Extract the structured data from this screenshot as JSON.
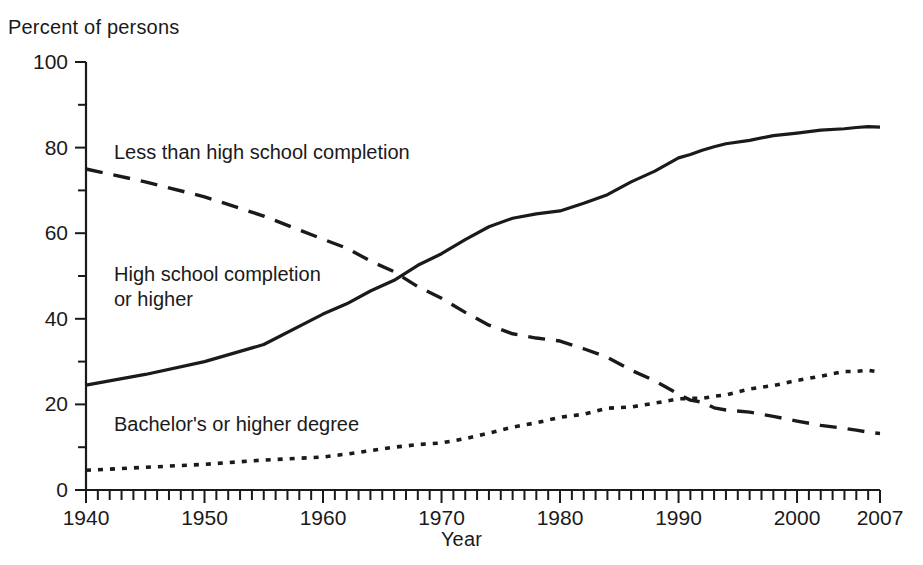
{
  "chart_data": {
    "type": "line",
    "title": "",
    "ylabel": "Percent of persons",
    "xlabel": "Year",
    "xlim": [
      1940,
      2007
    ],
    "ylim": [
      0,
      100
    ],
    "grid": false,
    "legend_position": "inline-annotations",
    "y_ticks": [
      0,
      20,
      40,
      60,
      80,
      100
    ],
    "y_minor_tick_interval": 10,
    "x_ticks": [
      1940,
      1950,
      1960,
      1970,
      1980,
      1990,
      2000,
      2007
    ],
    "x_minor_tick_interval": 1,
    "x": [
      1940,
      1945,
      1950,
      1955,
      1960,
      1962,
      1964,
      1966,
      1968,
      1970,
      1972,
      1974,
      1976,
      1978,
      1980,
      1982,
      1984,
      1986,
      1988,
      1990,
      1991,
      1992,
      1993,
      1994,
      1996,
      1998,
      2000,
      2002,
      2004,
      2005,
      2006,
      2007
    ],
    "series": [
      {
        "name": "Less than high school completion",
        "style": "dashed",
        "values": [
          75.0,
          72.0,
          68.5,
          64.0,
          58.6,
          56.5,
          53.5,
          51.0,
          47.5,
          44.8,
          41.5,
          38.5,
          36.5,
          35.5,
          34.8,
          33.0,
          31.0,
          28.0,
          25.5,
          22.4,
          21.0,
          20.5,
          19.2,
          18.7,
          18.2,
          17.2,
          16.1,
          15.1,
          14.4,
          14.0,
          13.5,
          13.2
        ]
      },
      {
        "name": "High school completion or higher",
        "style": "solid",
        "values": [
          24.5,
          27.0,
          30.0,
          34.0,
          41.1,
          43.5,
          46.5,
          49.0,
          52.5,
          55.2,
          58.5,
          61.5,
          63.5,
          64.5,
          65.2,
          67.0,
          69.0,
          72.0,
          74.5,
          77.6,
          78.4,
          79.4,
          80.2,
          80.9,
          81.7,
          82.8,
          83.4,
          84.1,
          84.4,
          84.7,
          84.9,
          84.8
        ]
      },
      {
        "name": "Bachelor's or higher degree",
        "style": "dotted",
        "values": [
          4.6,
          5.3,
          6.0,
          7.0,
          7.7,
          8.4,
          9.2,
          10.0,
          10.6,
          11.0,
          12.0,
          13.3,
          14.7,
          15.7,
          17.0,
          17.7,
          19.1,
          19.4,
          20.3,
          21.3,
          21.4,
          21.4,
          21.9,
          22.2,
          23.6,
          24.4,
          25.6,
          26.6,
          27.7,
          27.7,
          28.0,
          27.5
        ]
      }
    ]
  },
  "annotations": [
    {
      "text": "Less than high school completion",
      "series": "Less than high school completion"
    },
    {
      "text": "High school completion\nor higher",
      "series": "High school completion or higher"
    },
    {
      "text": "Bachelor's or higher degree",
      "series": "Bachelor's or higher degree"
    }
  ],
  "colors": {
    "ink": "#1a1a1a",
    "background": "#ffffff"
  }
}
